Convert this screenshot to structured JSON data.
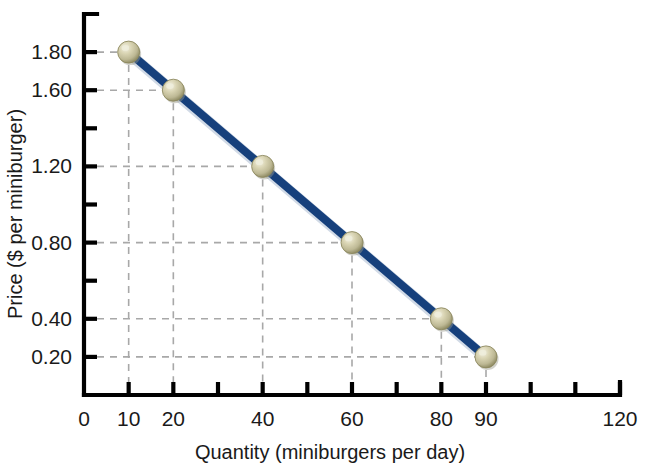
{
  "chart_data": {
    "type": "line",
    "title": "",
    "subtitle": "",
    "xlabel": "Quantity (miniburgers per day)",
    "ylabel": "Price ($ per miniburger)",
    "xlim": [
      0,
      120
    ],
    "ylim": [
      0,
      2.0
    ],
    "grid": true,
    "legend": null,
    "x": [
      10,
      20,
      40,
      60,
      80,
      90
    ],
    "values": [
      1.8,
      1.6,
      1.2,
      0.8,
      0.4,
      0.2
    ],
    "series": [
      {
        "name": "Demand",
        "x": [
          10,
          20,
          40,
          60,
          80,
          90
        ],
        "values": [
          1.8,
          1.6,
          1.2,
          0.8,
          0.4,
          0.2
        ]
      }
    ],
    "points": [
      {
        "x": 10,
        "y": 1.8,
        "label": "1.80"
      },
      {
        "x": 20,
        "y": 1.6,
        "label": "1.60"
      },
      {
        "x": 40,
        "y": 1.2,
        "label": "1.20"
      },
      {
        "x": 60,
        "y": 0.8,
        "label": "0.80"
      },
      {
        "x": 80,
        "y": 0.4,
        "label": "0.40"
      },
      {
        "x": 90,
        "y": 0.2,
        "label": "0.20"
      }
    ],
    "x_ticks": [
      0,
      10,
      20,
      30,
      40,
      50,
      60,
      70,
      80,
      90,
      100,
      110,
      120
    ],
    "x_tick_labels": [
      {
        "value": 0,
        "label": "0"
      },
      {
        "value": 10,
        "label": "10"
      },
      {
        "value": 20,
        "label": "20"
      },
      {
        "value": 40,
        "label": "40"
      },
      {
        "value": 60,
        "label": "60"
      },
      {
        "value": 80,
        "label": "80"
      },
      {
        "value": 90,
        "label": "90"
      },
      {
        "value": 120,
        "label": "120"
      }
    ],
    "y_ticks": [
      0.2,
      0.4,
      0.6,
      0.8,
      1.0,
      1.2,
      1.4,
      1.6,
      1.8
    ],
    "y_tick_labels": [
      {
        "value": 0.2,
        "label": "0.20"
      },
      {
        "value": 0.4,
        "label": "0.40"
      },
      {
        "value": 0.8,
        "label": "0.80"
      },
      {
        "value": 1.2,
        "label": "1.20"
      },
      {
        "value": 1.6,
        "label": "1.60"
      },
      {
        "value": 1.8,
        "label": "1.80"
      }
    ],
    "colors": {
      "line": "#16407c",
      "line_shadow": "#0d2b57",
      "marker_fill": "#cfc9a4",
      "marker_edge": "#8d8960",
      "marker_highlight": "#efeddc",
      "axis": "#000000",
      "grid": "#a8a8a8",
      "text": "#1a1a1a",
      "background": "#ffffff"
    }
  }
}
